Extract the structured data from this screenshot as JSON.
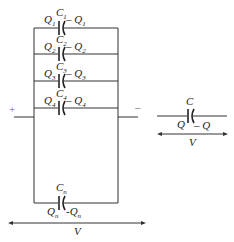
{
  "diagram": {
    "parallel_network": {
      "capacitors": [
        {
          "name": "C",
          "sub": "1",
          "left_charge": "Q",
          "left_sub": "1",
          "right_charge": "– Q",
          "right_sub": "1"
        },
        {
          "name": "C",
          "sub": "2",
          "left_charge": "Q",
          "left_sub": "2",
          "right_charge": "– Q",
          "right_sub": "2"
        },
        {
          "name": "C",
          "sub": "3",
          "left_charge": "Q",
          "left_sub": "3",
          "right_charge": "– Q",
          "right_sub": "3"
        },
        {
          "name": "C",
          "sub": "4",
          "left_charge": "Q",
          "left_sub": "4",
          "right_charge": "– Q",
          "right_sub": "4"
        },
        {
          "name": "C",
          "sub": "n",
          "left_charge": "Q",
          "left_sub": "n",
          "right_charge": "-Q",
          "right_sub": "n"
        }
      ],
      "plus_terminal": "+",
      "minus_terminal": "–",
      "voltage_label": "V"
    },
    "equivalent": {
      "name": "C",
      "left_charge": "Q",
      "right_charge": "– Q",
      "voltage_label": "V"
    }
  }
}
